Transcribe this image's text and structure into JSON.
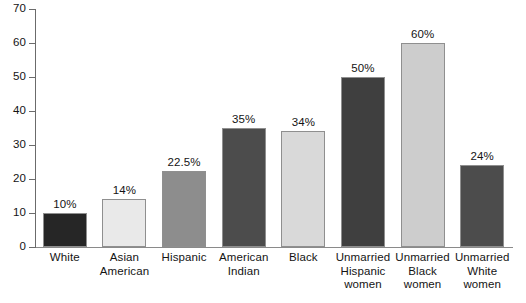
{
  "chart_data": {
    "type": "bar",
    "title": "",
    "subtitle": "",
    "xlabel": "",
    "ylabel": "",
    "ylim": [
      0,
      70
    ],
    "grid": false,
    "legend": "none",
    "y_ticks": [
      0,
      10,
      20,
      30,
      40,
      50,
      60,
      70
    ],
    "y_tick_labels": [
      "0",
      "10",
      "20",
      "30",
      "40",
      "50",
      "60",
      "70"
    ],
    "categories": [
      "White",
      "Asian American",
      "Hispanic",
      "American Indian",
      "Black",
      "Unmarried Hispanic women",
      "Unmarried Black women",
      "Unmarried White women"
    ],
    "category_label_lines": [
      [
        "White"
      ],
      [
        "Asian",
        "American"
      ],
      [
        "Hispanic"
      ],
      [
        "American",
        "Indian"
      ],
      [
        "Black"
      ],
      [
        "Unmarried",
        "Hispanic",
        "women"
      ],
      [
        "Unmarried",
        "Black",
        "women"
      ],
      [
        "Unmarried",
        "White",
        "women"
      ]
    ],
    "values": [
      10,
      14,
      22.5,
      35,
      34,
      50,
      60,
      24
    ],
    "value_labels": [
      "10%",
      "14%",
      "22.5%",
      "35%",
      "34%",
      "50%",
      "60%",
      "24%"
    ],
    "bar_colors": [
      "#262626",
      "#e9e9e9",
      "#8d8d8d",
      "#4c4c4c",
      "#d9d9d9",
      "#3f3f3f",
      "#cdcdcd",
      "#4c4c4c"
    ],
    "bar_edge_color": "#8f8f8f",
    "axis_color": "#6b6b6b"
  }
}
